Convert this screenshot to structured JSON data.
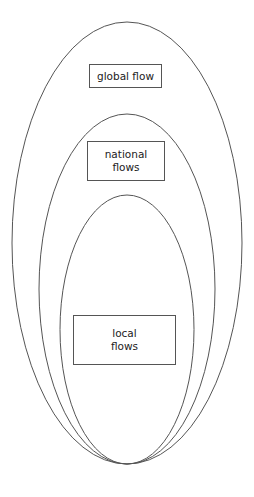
{
  "diagram": {
    "title": "",
    "levels": [
      {
        "id": "global",
        "label": "global flow"
      },
      {
        "id": "national",
        "label": "national\nflows"
      },
      {
        "id": "local",
        "label": "local\nflows"
      }
    ],
    "stroke_color": "#555555",
    "relationship": "nested"
  }
}
